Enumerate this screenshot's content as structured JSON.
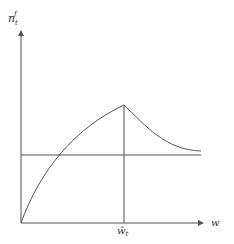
{
  "diagram": {
    "y_axis_label": "n",
    "y_axis_label_sub": "t",
    "y_axis_label_sup": "f",
    "x_axis_label": "w",
    "x_tick_label": "ŵ",
    "x_tick_label_sub": "t",
    "colors": {
      "line": "#555555",
      "text": "#333333",
      "background": "#ffffff"
    },
    "geometry": {
      "origin": [
        21,
        223
      ],
      "y_axis_top": 30,
      "x_axis_right": 204,
      "horizontal_line_y": 155,
      "horizontal_line_right": 201,
      "peak": [
        124,
        105
      ],
      "curve_end": [
        201,
        151
      ],
      "tick_x": 124
    }
  }
}
